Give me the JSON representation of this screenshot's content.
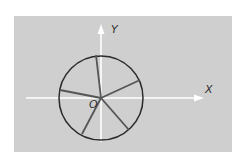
{
  "diagram": {
    "background_color": "#cfcfcf",
    "page_color": "#ffffff",
    "axis_color": "#ffffff",
    "circle_color": "#2a2a2a",
    "spoke_color": "#555555",
    "labels": {
      "x_axis": "X",
      "y_axis": "Y",
      "origin": "O"
    },
    "circle": {
      "cx": 101,
      "cy": 98,
      "r": 42
    },
    "spoke_count": 5
  }
}
